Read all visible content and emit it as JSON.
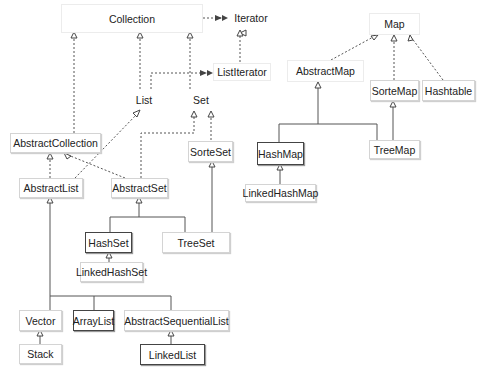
{
  "diagram": {
    "nodes": {
      "collection": "Collection",
      "iterator": "Iterator",
      "list_iterator": "ListIterator",
      "list": "List",
      "set": "Set",
      "abstract_collection": "AbstractCollection",
      "sorted_set": "SorteSet",
      "abstract_list": "AbstractList",
      "abstract_set": "AbstractSet",
      "hash_set": "HashSet",
      "tree_set": "TreeSet",
      "linked_hash_set": "LinkedHashSet",
      "vector": "Vector",
      "array_list": "ArrayList",
      "abstract_sequential_list": "AbstractSequentialList",
      "stack": "Stack",
      "linked_list": "LinkedList",
      "map": "Map",
      "abstract_map": "AbstractMap",
      "sorted_map": "SorteMap",
      "hashtable": "Hashtable",
      "hash_map": "HashMap",
      "tree_map": "TreeMap",
      "linked_hash_map": "LinkedHashMap"
    },
    "edges": [
      {
        "from": "Collection",
        "to": "Iterator",
        "style": "dashed",
        "arrow": "open"
      },
      {
        "from": "ListIterator",
        "to": "Iterator",
        "style": "dashed",
        "arrow": "hollow-triangle"
      },
      {
        "from": "List",
        "to": "ListIterator",
        "style": "dashed",
        "arrow": "open"
      },
      {
        "from": "List",
        "to": "Collection",
        "style": "dashed",
        "arrow": "hollow-triangle"
      },
      {
        "from": "Set",
        "to": "Collection",
        "style": "dashed",
        "arrow": "hollow-triangle"
      },
      {
        "from": "AbstractCollection",
        "to": "Collection",
        "style": "dashed",
        "arrow": "hollow-triangle"
      },
      {
        "from": "SorteSet",
        "to": "Set",
        "style": "dashed",
        "arrow": "hollow-triangle"
      },
      {
        "from": "AbstractSet",
        "to": "Set",
        "style": "dashed",
        "arrow": "hollow-triangle"
      },
      {
        "from": "AbstractList",
        "to": "List",
        "style": "dashed",
        "arrow": "hollow-triangle"
      },
      {
        "from": "AbstractList",
        "to": "AbstractCollection",
        "style": "dashed",
        "arrow": "hollow-triangle"
      },
      {
        "from": "AbstractSet",
        "to": "AbstractCollection",
        "style": "dashed",
        "arrow": "hollow-triangle"
      },
      {
        "from": "HashSet",
        "to": "AbstractSet",
        "style": "solid",
        "arrow": "hollow-triangle"
      },
      {
        "from": "TreeSet",
        "to": "AbstractSet",
        "style": "solid",
        "arrow": "hollow-triangle"
      },
      {
        "from": "TreeSet",
        "to": "SorteSet",
        "style": "solid",
        "arrow": "hollow-triangle"
      },
      {
        "from": "LinkedHashSet",
        "to": "HashSet",
        "style": "solid",
        "arrow": "hollow-triangle"
      },
      {
        "from": "Vector",
        "to": "AbstractList",
        "style": "solid",
        "arrow": "hollow-triangle"
      },
      {
        "from": "ArrayList",
        "to": "AbstractList",
        "style": "solid",
        "arrow": "hollow-triangle"
      },
      {
        "from": "AbstractSequentialList",
        "to": "AbstractList",
        "style": "solid",
        "arrow": "hollow-triangle"
      },
      {
        "from": "Stack",
        "to": "Vector",
        "style": "solid",
        "arrow": "hollow-triangle"
      },
      {
        "from": "LinkedList",
        "to": "AbstractSequentialList",
        "style": "solid",
        "arrow": "hollow-triangle"
      },
      {
        "from": "AbstractMap",
        "to": "Map",
        "style": "dashed",
        "arrow": "hollow-triangle"
      },
      {
        "from": "SorteMap",
        "to": "Map",
        "style": "dashed",
        "arrow": "hollow-triangle"
      },
      {
        "from": "Hashtable",
        "to": "Map",
        "style": "dashed",
        "arrow": "hollow-triangle"
      },
      {
        "from": "HashMap",
        "to": "AbstractMap",
        "style": "solid",
        "arrow": "hollow-triangle"
      },
      {
        "from": "TreeMap",
        "to": "AbstractMap",
        "style": "solid",
        "arrow": "hollow-triangle"
      },
      {
        "from": "TreeMap",
        "to": "SorteMap",
        "style": "solid",
        "arrow": "hollow-triangle"
      },
      {
        "from": "LinkedHashMap",
        "to": "HashMap",
        "style": "solid",
        "arrow": "hollow-triangle"
      }
    ],
    "highlighted_nodes": [
      "HashSet",
      "ArrayList",
      "LinkedList",
      "HashMap"
    ]
  }
}
